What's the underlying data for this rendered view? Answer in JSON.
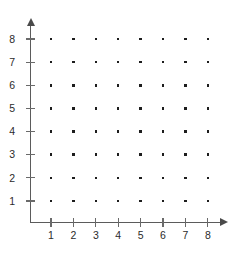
{
  "figure": {
    "background_color": "#ffffff",
    "axis_color": "#5b5b5b",
    "tick_color": "#6a6a6a",
    "dot_color": "#1d1d1d",
    "label_color": "#2b2b2b"
  },
  "axes": {
    "x": {
      "label": "",
      "tick_labels": [
        "1",
        "2",
        "3",
        "4",
        "5",
        "6",
        "7",
        "8"
      ],
      "arrow_icon": "arrow-right-icon",
      "range": [
        0,
        8
      ]
    },
    "y": {
      "label": "",
      "tick_labels": [
        "8",
        "7",
        "6",
        "5",
        "4",
        "3",
        "2",
        "1"
      ],
      "arrow_icon": "arrow-up-icon",
      "range": [
        0,
        8
      ]
    }
  },
  "chart_data": {
    "type": "scatter",
    "title": "",
    "subtitle": "",
    "xlabel": "",
    "ylabel": "",
    "xlim": [
      0,
      8.8
    ],
    "ylim": [
      0,
      8.8
    ],
    "xticks": [
      1,
      2,
      3,
      4,
      5,
      6,
      7,
      8
    ],
    "yticks": [
      1,
      2,
      3,
      4,
      5,
      6,
      7,
      8
    ],
    "grid": false,
    "legend": null,
    "annotations": [],
    "series": [
      {
        "name": "lattice points",
        "marker": "square",
        "color": "#1d1d1d",
        "points": [
          [
            1,
            1
          ],
          [
            2,
            1
          ],
          [
            3,
            1
          ],
          [
            4,
            1
          ],
          [
            5,
            1
          ],
          [
            6,
            1
          ],
          [
            7,
            1
          ],
          [
            8,
            1
          ],
          [
            1,
            2
          ],
          [
            2,
            2
          ],
          [
            3,
            2
          ],
          [
            4,
            2
          ],
          [
            5,
            2
          ],
          [
            6,
            2
          ],
          [
            7,
            2
          ],
          [
            8,
            2
          ],
          [
            1,
            3
          ],
          [
            2,
            3
          ],
          [
            3,
            3
          ],
          [
            4,
            3
          ],
          [
            5,
            3
          ],
          [
            6,
            3
          ],
          [
            7,
            3
          ],
          [
            8,
            3
          ],
          [
            1,
            4
          ],
          [
            2,
            4
          ],
          [
            3,
            4
          ],
          [
            4,
            4
          ],
          [
            5,
            4
          ],
          [
            6,
            4
          ],
          [
            7,
            4
          ],
          [
            8,
            4
          ],
          [
            1,
            5
          ],
          [
            2,
            5
          ],
          [
            3,
            5
          ],
          [
            4,
            5
          ],
          [
            5,
            5
          ],
          [
            6,
            5
          ],
          [
            7,
            5
          ],
          [
            8,
            5
          ],
          [
            1,
            6
          ],
          [
            2,
            6
          ],
          [
            3,
            6
          ],
          [
            4,
            6
          ],
          [
            5,
            6
          ],
          [
            6,
            6
          ],
          [
            7,
            6
          ],
          [
            8,
            6
          ],
          [
            1,
            7
          ],
          [
            2,
            7
          ],
          [
            3,
            7
          ],
          [
            4,
            7
          ],
          [
            5,
            7
          ],
          [
            6,
            7
          ],
          [
            7,
            7
          ],
          [
            8,
            7
          ],
          [
            1,
            8
          ],
          [
            2,
            8
          ],
          [
            3,
            8
          ],
          [
            4,
            8
          ],
          [
            5,
            8
          ],
          [
            6,
            8
          ],
          [
            7,
            8
          ],
          [
            8,
            8
          ]
        ]
      }
    ]
  },
  "geometry": {
    "origin_px": [
      31,
      222
    ],
    "x_positions_px": [
      51,
      73.4,
      95.8,
      118.2,
      140.6,
      163,
      185.4,
      207.8
    ],
    "y_positions_px": [
      201,
      177.8,
      154.7,
      131.6,
      108.4,
      85.3,
      62.1,
      39
    ]
  }
}
